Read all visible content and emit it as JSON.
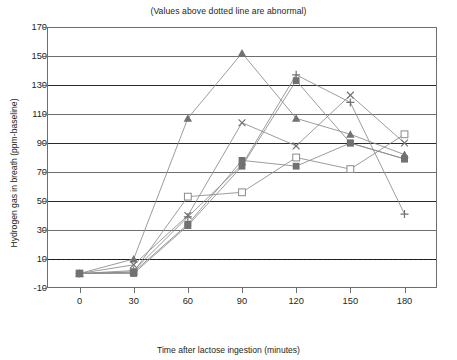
{
  "chart_data": {
    "type": "line",
    "title": "(Values above dotted line are abnormal)",
    "xlabel": "Time after lactose ingestion (minutes)",
    "ylabel": "Hydrogen gas in breath (ppm-baseline)",
    "x": [
      0,
      30,
      60,
      90,
      120,
      150,
      180
    ],
    "xtick_labels": [
      "0",
      "30",
      "60",
      "90",
      "120",
      "150",
      "180"
    ],
    "ytick_labels": [
      "-10",
      "10",
      "30",
      "50",
      "70",
      "90",
      "110",
      "130",
      "150",
      "170"
    ],
    "ylim": [
      -10,
      170
    ],
    "xlim": [
      -18,
      198
    ],
    "grid": true,
    "legend": "none",
    "threshold": 10,
    "threshold_note": "dotted line at 10 ppm marks the abnormal cut-off",
    "series": [
      {
        "name": "Patient 1",
        "marker": "filled-triangle",
        "values": [
          0,
          10,
          107,
          152,
          107,
          96,
          82
        ]
      },
      {
        "name": "Patient 2",
        "marker": "cross-x",
        "values": [
          0,
          6,
          40,
          104,
          88,
          123,
          90
        ]
      },
      {
        "name": "Patient 3",
        "marker": "plus",
        "values": [
          0,
          2,
          39,
          75,
          137,
          118,
          41
        ]
      },
      {
        "name": "Patient 4",
        "marker": "open-square",
        "values": [
          0,
          1,
          53,
          56,
          80,
          72,
          96
        ]
      },
      {
        "name": "Patient 5",
        "marker": "filled-square",
        "values": [
          0,
          0,
          33,
          74,
          133,
          90,
          79
        ]
      },
      {
        "name": "Patient 6",
        "marker": "filled-square-2",
        "values": [
          0,
          1,
          34,
          78,
          74,
          90,
          79
        ]
      }
    ]
  }
}
